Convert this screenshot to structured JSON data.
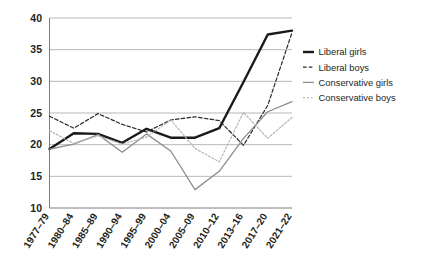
{
  "chart_data": {
    "type": "line",
    "title": "",
    "subtitle": "",
    "xlabel": "",
    "ylabel": "",
    "ylim": [
      10,
      40
    ],
    "yticks": [
      10,
      15,
      20,
      25,
      30,
      35,
      40
    ],
    "grid": true,
    "legend_position": "right",
    "categories": [
      "1977–79",
      "1980–84",
      "1985–89",
      "1990–94",
      "1995–99",
      "2000–04",
      "2005–09",
      "2010–12",
      "2013–16",
      "2017–20",
      "2021–22"
    ],
    "series": [
      {
        "name": "Liberal girls",
        "color": "#1a1a1a",
        "style": "solid",
        "width": 2.4,
        "values": [
          19.3,
          21.8,
          21.7,
          20.3,
          22.5,
          21.1,
          21.1,
          22.6,
          29.9,
          37.4,
          38.0
        ]
      },
      {
        "name": "Liberal boys",
        "color": "#2b2b2b",
        "style": "dashed",
        "width": 1.2,
        "values": [
          24.5,
          22.6,
          24.9,
          23.2,
          22.0,
          23.9,
          24.4,
          23.8,
          19.9,
          26.2,
          37.7
        ]
      },
      {
        "name": "Conservative girls",
        "color": "#8d8d8d",
        "style": "solid",
        "width": 1.3,
        "values": [
          19.3,
          20.1,
          21.6,
          18.8,
          21.7,
          19.0,
          12.9,
          15.8,
          21.0,
          25.2,
          26.8
        ]
      },
      {
        "name": "Conservative boys",
        "color": "#b4b4b4",
        "style": "dotted",
        "width": 1.2,
        "values": [
          22.2,
          20.2,
          21.4,
          20.1,
          21.2,
          23.9,
          19.4,
          17.3,
          25.1,
          21.0,
          24.3
        ]
      }
    ]
  },
  "legend": {
    "items": [
      {
        "label": "Liberal girls"
      },
      {
        "label": "Liberal boys"
      },
      {
        "label": "Conservative girls"
      },
      {
        "label": "Conservative boys"
      }
    ]
  }
}
